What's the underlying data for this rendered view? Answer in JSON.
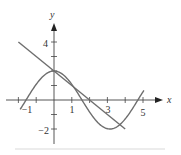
{
  "chart_data": {
    "type": "line",
    "title": "",
    "xlabel": "x",
    "ylabel": "y",
    "xlim": [
      -2.1,
      5.9
    ],
    "ylim": [
      -2.5,
      5.4
    ],
    "x_tick_labels": [
      "-1",
      "1",
      "3",
      "5"
    ],
    "x_ticks": [
      -2,
      -1,
      0,
      1,
      2,
      3,
      4,
      5
    ],
    "y_tick_labels": [
      "4",
      "-2"
    ],
    "y_ticks": [
      -2,
      -1,
      1,
      2,
      3,
      4
    ],
    "grid": false,
    "series": [
      {
        "name": "curve y = 2cos(x)",
        "expression": "2*cos(x)",
        "x_range": [
          -1.9,
          5.05
        ],
        "points": [
          [
            -1.9,
            -0.65
          ],
          [
            -1,
            1.08
          ],
          [
            0,
            2
          ],
          [
            1,
            1.08
          ],
          [
            1.57,
            0
          ],
          [
            2,
            -0.83
          ],
          [
            3,
            -1.98
          ],
          [
            3.14,
            -2
          ],
          [
            4,
            -1.31
          ],
          [
            4.71,
            0
          ],
          [
            5.05,
            0.66
          ]
        ],
        "color": "#6e6e6e"
      },
      {
        "name": "tangent line y = 2 - x",
        "expression": "2 - x",
        "x_range": [
          -2,
          4
        ],
        "points": [
          [
            -2,
            4
          ],
          [
            0,
            2
          ],
          [
            4,
            -2
          ]
        ],
        "color": "#6e6e6e"
      }
    ]
  },
  "axes": {
    "x_label": "x",
    "y_label": "y",
    "x_ticks": [
      {
        "value": -1,
        "label": "−1"
      },
      {
        "value": 1,
        "label": "1"
      },
      {
        "value": 3,
        "label": "3"
      },
      {
        "value": 5,
        "label": "5"
      }
    ],
    "y_ticks": [
      {
        "value": 4,
        "label": "4"
      },
      {
        "value": -2,
        "label": "−2"
      }
    ]
  }
}
